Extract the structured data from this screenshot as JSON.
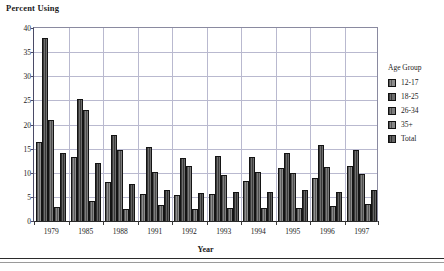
{
  "chart_data": {
    "type": "bar",
    "title": "",
    "ylabel": "Percent Using",
    "xlabel": "Year",
    "categories": [
      "1979",
      "1985",
      "1988",
      "1991",
      "1992",
      "1993",
      "1994",
      "1995",
      "1996",
      "1997"
    ],
    "ylim": [
      0,
      40
    ],
    "yticks": [
      0,
      5,
      10,
      15,
      20,
      25,
      30,
      35,
      40
    ],
    "grid": true,
    "legend_title": "Age Group",
    "legend_position": "right",
    "series": [
      {
        "name": "12-17",
        "values": [
          16.3,
          13.2,
          8.1,
          5.7,
          5.3,
          5.7,
          8.2,
          10.9,
          9.0,
          11.4
        ]
      },
      {
        "name": "18-25",
        "values": [
          38.0,
          25.3,
          17.9,
          15.4,
          13.1,
          13.5,
          13.3,
          14.2,
          15.8,
          14.7
        ]
      },
      {
        "name": "26-34",
        "values": [
          21.0,
          23.1,
          14.8,
          10.1,
          11.4,
          9.5,
          10.1,
          10.0,
          11.2,
          9.7
        ]
      },
      {
        "name": "35+",
        "values": [
          2.9,
          4.1,
          2.4,
          3.4,
          2.5,
          2.8,
          2.7,
          2.8,
          3.2,
          3.5
        ]
      },
      {
        "name": "Total",
        "values": [
          14.0,
          12.1,
          7.7,
          6.5,
          5.8,
          6.0,
          6.1,
          6.4,
          6.1,
          6.5
        ]
      }
    ],
    "series_colors": [
      "#5b5b5b",
      "#3a3a3a",
      "#4d4d4d",
      "#555555",
      "#2e2e2e"
    ]
  }
}
